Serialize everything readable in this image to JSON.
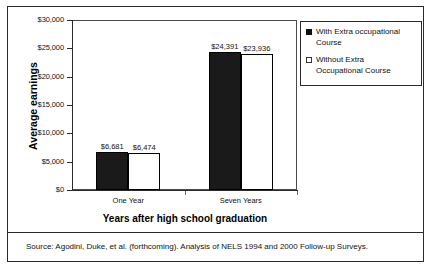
{
  "chart_data": {
    "type": "bar",
    "title": "",
    "xlabel": "Years after high school graduation",
    "ylabel": "Average earnings",
    "categories": [
      "One Year",
      "Seven Years"
    ],
    "series": [
      {
        "name": "With Extra occupational Course",
        "values": [
          6681,
          23936000
        ],
        "value_labels": [
          "$6,681",
          "$24,391"
        ],
        "numeric_values": [
          6681,
          24391
        ],
        "style": "filled"
      },
      {
        "name": "Without Extra Occupational Course",
        "values": [
          6474,
          23936
        ],
        "value_labels": [
          "$6,474",
          "$23,936"
        ],
        "numeric_values": [
          6474,
          23936
        ],
        "style": "hollow"
      }
    ],
    "ylim": [
      0,
      30000
    ],
    "ytick_values": [
      0,
      5000,
      10000,
      15000,
      20000,
      25000,
      30000
    ],
    "ytick_labels": [
      "$0",
      "$5,000",
      "$10,000",
      "$15,000",
      "$20,000",
      "$25,000",
      "$30,000"
    ],
    "grid": false,
    "legend_position": "upper-right",
    "colors": {
      "filled": "#1a1a1a",
      "hollow": "#ffffff",
      "outline": "#000000",
      "axis": "#2b2b2b"
    }
  },
  "axes": {
    "y_title": "Average earnings",
    "x_title": "Years after high school graduation"
  },
  "legend": {
    "items": [
      {
        "label_line1": "With Extra occupational",
        "label_line2": "Course",
        "swatch": "filled-square-icon"
      },
      {
        "label_line1": "Without Extra",
        "label_line2": "Occupational Course",
        "swatch": "hollow-square-icon"
      }
    ]
  },
  "source": {
    "text": "Source: Agodini, Duke, et al. (forthcoming). Analysis of NELS 1994 and 2000 Follow-up Surveys."
  }
}
